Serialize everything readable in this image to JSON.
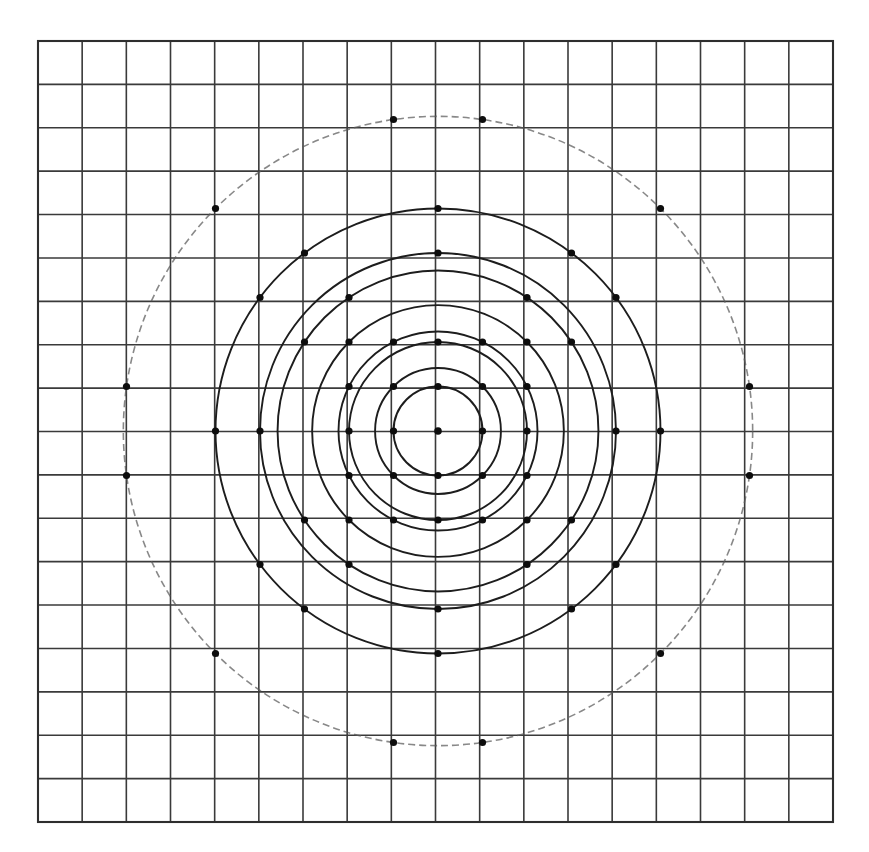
{
  "figure": {
    "caption_partial": "p gg g pp g",
    "type": "diagram",
    "background_color": "#ffffff",
    "ink_color": "#1d1d1d",
    "faint_ink_color": "#5a5a5a"
  },
  "grid": {
    "origin_px": {
      "x": 438,
      "y": 431
    },
    "unit_px": 44.5,
    "columns": 18,
    "rows": 18,
    "left_px": 38,
    "top_px": 41,
    "right_px": 833,
    "bottom_px": 822,
    "line_color": "#3a3a3a",
    "border_color": "#2e2e2e",
    "x_min_unit": -9,
    "x_max_unit": 9,
    "y_min_unit": -9,
    "y_max_unit": 8
  },
  "chart_data": {
    "type": "scatter",
    "xlabel": "",
    "ylabel": "",
    "xlim": [
      -9,
      9
    ],
    "ylim": [
      -8.8,
      8.8
    ],
    "grid": true,
    "legend": null,
    "center": [
      0,
      0
    ],
    "circles": [
      {
        "name": "r = 1",
        "radius_units": 1,
        "radius_label": "1",
        "r_squared": 1,
        "style": "solid",
        "lattice_point_count": 4
      },
      {
        "name": "r = sqrt(2)",
        "radius_units": 1.4142,
        "radius_label": "√2",
        "r_squared": 2,
        "style": "solid",
        "lattice_point_count": 4
      },
      {
        "name": "r = 2",
        "radius_units": 2,
        "radius_label": "2",
        "r_squared": 4,
        "style": "solid",
        "lattice_point_count": 4
      },
      {
        "name": "r = sqrt(5)",
        "radius_units": 2.2361,
        "radius_label": "√5",
        "r_squared": 5,
        "style": "solid",
        "lattice_point_count": 8
      },
      {
        "name": "r = sqrt(8)",
        "radius_units": 2.8284,
        "radius_label": "√8",
        "r_squared": 8,
        "style": "solid",
        "lattice_point_count": 4
      },
      {
        "name": "r = sqrt(13)",
        "radius_units": 3.6056,
        "radius_label": "√13",
        "r_squared": 13,
        "style": "solid",
        "lattice_point_count": 8
      },
      {
        "name": "r = 4",
        "radius_units": 4,
        "radius_label": "4",
        "r_squared": 16,
        "style": "solid",
        "lattice_point_count": 4
      },
      {
        "name": "r = 5",
        "radius_units": 5,
        "radius_label": "5",
        "r_squared": 25,
        "style": "solid",
        "lattice_point_count": 12
      },
      {
        "name": "r = sqrt(50)",
        "radius_units": 7.0711,
        "radius_label": "√50",
        "r_squared": 50,
        "style": "faint",
        "lattice_point_count": 12
      }
    ],
    "points": [
      [
        1,
        0
      ],
      [
        -1,
        0
      ],
      [
        0,
        1
      ],
      [
        0,
        -1
      ],
      [
        1,
        1
      ],
      [
        1,
        -1
      ],
      [
        -1,
        1
      ],
      [
        -1,
        -1
      ],
      [
        2,
        0
      ],
      [
        -2,
        0
      ],
      [
        0,
        2
      ],
      [
        0,
        -2
      ],
      [
        2,
        1
      ],
      [
        1,
        2
      ],
      [
        -1,
        2
      ],
      [
        -2,
        1
      ],
      [
        -2,
        -1
      ],
      [
        -1,
        -2
      ],
      [
        1,
        -2
      ],
      [
        2,
        -1
      ],
      [
        2,
        2
      ],
      [
        2,
        -2
      ],
      [
        -2,
        2
      ],
      [
        -2,
        -2
      ],
      [
        3,
        2
      ],
      [
        2,
        3
      ],
      [
        -2,
        3
      ],
      [
        -3,
        2
      ],
      [
        -3,
        -2
      ],
      [
        -2,
        -3
      ],
      [
        2,
        -3
      ],
      [
        3,
        -2
      ],
      [
        4,
        0
      ],
      [
        -4,
        0
      ],
      [
        0,
        4
      ],
      [
        0,
        -4
      ],
      [
        5,
        0
      ],
      [
        -5,
        0
      ],
      [
        0,
        5
      ],
      [
        0,
        -5
      ],
      [
        4,
        3
      ],
      [
        3,
        4
      ],
      [
        -3,
        4
      ],
      [
        -4,
        3
      ],
      [
        -4,
        -3
      ],
      [
        -3,
        -4
      ],
      [
        3,
        -4
      ],
      [
        4,
        -3
      ],
      [
        7,
        1
      ],
      [
        1,
        7
      ],
      [
        -1,
        7
      ],
      [
        -7,
        1
      ],
      [
        -7,
        -1
      ],
      [
        -1,
        -7
      ],
      [
        1,
        -7
      ],
      [
        7,
        -1
      ],
      [
        5,
        5
      ],
      [
        5,
        -5
      ],
      [
        -5,
        5
      ],
      [
        -5,
        -5
      ]
    ]
  }
}
